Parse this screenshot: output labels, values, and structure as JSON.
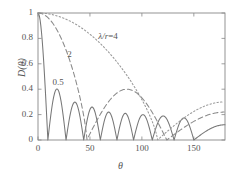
{
  "chart_data": {
    "type": "line",
    "title": "",
    "xlabel": "θ",
    "ylabel": "D(θ)",
    "xlim": [
      0,
      180
    ],
    "ylim": [
      0,
      1
    ],
    "xticks": [
      0,
      50,
      100,
      150
    ],
    "yticks": [
      0,
      0.2,
      0.4,
      0.6,
      0.8,
      1
    ],
    "xtick_labels": [
      "0",
      "50",
      "100",
      "150"
    ],
    "ytick_labels": [
      "0",
      "0.2",
      "0.4",
      "0.6",
      "0.8",
      "1"
    ],
    "grid": false,
    "legend_position": "inline-annotations",
    "annotations": [
      {
        "text": "λ/r=4",
        "x": 60,
        "y": 0.8,
        "series": "lambda_over_r_4"
      },
      {
        "text": "2",
        "x": 30,
        "y": 0.66,
        "series": "lambda_over_r_2"
      },
      {
        "text": "0.5",
        "x": 16,
        "y": 0.44,
        "series": "lambda_over_r_0p5"
      }
    ],
    "series": [
      {
        "name": "λ/r=0.5",
        "key": "lambda_over_r_0p5",
        "style": "solid",
        "color": "#777777",
        "description": "Rapidly oscillating directivity with eight nulls; main lobe narrow, sidelobe peaks decaying from 0.41",
        "nulls": [
          9.5,
          27,
          44,
          60,
          76,
          92,
          110,
          131,
          150
        ],
        "peaks": [
          {
            "x": 0,
            "y": 1.0
          },
          {
            "x": 17,
            "y": 0.41
          },
          {
            "x": 35,
            "y": 0.3
          },
          {
            "x": 52,
            "y": 0.26
          },
          {
            "x": 68,
            "y": 0.22
          },
          {
            "x": 84,
            "y": 0.21
          },
          {
            "x": 101,
            "y": 0.2
          },
          {
            "x": 120,
            "y": 0.19
          },
          {
            "x": 140,
            "y": 0.175
          },
          {
            "x": 180,
            "y": 0.12
          }
        ],
        "value_at_180": 0.12
      },
      {
        "name": "λ/r=2",
        "key": "lambda_over_r_2",
        "style": "dashed",
        "color": "#8a8a8a",
        "description": "Broad main lobe falling to a null near 47 degrees, secondary lobe peaking 0.40 near 76 degrees, second null near 124 degrees, rising to 0.22 at 180",
        "nulls": [
          47,
          124
        ],
        "peaks": [
          {
            "x": 0,
            "y": 1.0
          },
          {
            "x": 76,
            "y": 0.4
          },
          {
            "x": 180,
            "y": 0.22
          }
        ],
        "value_at_180": 0.22
      },
      {
        "name": "λ/r=4",
        "key": "lambda_over_r_4",
        "style": "dotted",
        "color": "#999999",
        "description": "Very broad main lobe decaying monotonically to a shallow null near 115 degrees then rising to 0.30 at 180 degrees",
        "nulls": [
          115
        ],
        "peaks": [
          {
            "x": 0,
            "y": 1.0
          },
          {
            "x": 180,
            "y": 0.3
          }
        ],
        "value_at_180": 0.3
      }
    ]
  },
  "axes": {
    "y_axis_label": "D(θ)",
    "x_axis_label": "θ"
  }
}
